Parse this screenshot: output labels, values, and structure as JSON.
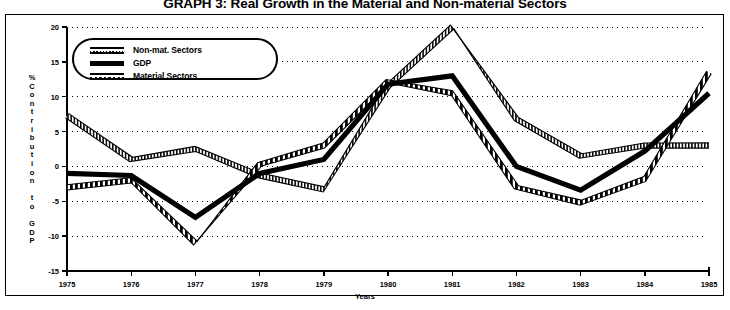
{
  "title": "GRAPH 3: Real Growth in the Material and Non-material Sectors",
  "axis": {
    "y_title_chars": [
      "%",
      "C",
      "o",
      "n",
      "t",
      "r",
      "i",
      "b",
      "u",
      "t",
      "i",
      "o",
      "n",
      "",
      "t",
      "o",
      "",
      "G",
      "D",
      "P"
    ],
    "x_title": "Years"
  },
  "legend": {
    "items": [
      {
        "label": "Non-mat. Sectors",
        "style": "dotted-band",
        "color": "#000000"
      },
      {
        "label": "GDP",
        "style": "solid-thick",
        "color": "#000000"
      },
      {
        "label": "Material Sectors",
        "style": "dashed-band",
        "color": "#000000"
      }
    ]
  },
  "chart_data": {
    "type": "line",
    "title": "GRAPH 3: Real Growth in the Material and Non-material Sectors",
    "xlabel": "Years",
    "ylabel": "% Contribution to GDP",
    "categories": [
      "1975",
      "1976",
      "1977",
      "1978",
      "1979",
      "1980",
      "1981",
      "1982",
      "1983",
      "1984",
      "1985"
    ],
    "x": [
      1975,
      1976,
      1977,
      1978,
      1979,
      1980,
      1981,
      1982,
      1983,
      1984,
      1985
    ],
    "ylim": [
      -15,
      20
    ],
    "yticks": [
      20,
      15,
      10,
      5,
      0,
      -5,
      -10,
      -15
    ],
    "ytick_labels": [
      "20",
      "15",
      "10",
      "5",
      "0",
      "-5",
      "-10",
      "-15"
    ],
    "grid": true,
    "grid_style": "dotted-horizontal",
    "legend_position": "upper-left-inside",
    "series": [
      {
        "name": "Non-mat. Sectors",
        "style": "dotted-band",
        "values": [
          7.3,
          1.0,
          2.5,
          -1.3,
          -3.3,
          11.5,
          20.0,
          6.8,
          1.5,
          3.0,
          3.0
        ]
      },
      {
        "name": "GDP",
        "style": "solid-thick",
        "values": [
          -1.0,
          -1.3,
          -7.3,
          -1.0,
          1.0,
          11.8,
          13.0,
          0.0,
          -3.4,
          2.2,
          10.5
        ]
      },
      {
        "name": "Material Sectors",
        "style": "dashed-band",
        "values": [
          -3.0,
          -2.0,
          -11.0,
          0.3,
          3.0,
          12.2,
          10.5,
          -3.0,
          -5.2,
          -1.8,
          13.5
        ]
      }
    ]
  }
}
